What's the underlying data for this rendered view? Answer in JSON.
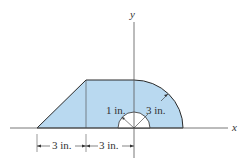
{
  "diagram": {
    "axes": {
      "x_label": "x",
      "y_label": "y"
    },
    "dimensions": {
      "inner_radius": "1 in.",
      "outer_radius": "3 in.",
      "left_width": "3 in.",
      "middle_width": "3 in."
    },
    "colors": {
      "fill": "#b9d9f0",
      "stroke": "#2a2a2a",
      "hole": "#ffffff"
    }
  }
}
